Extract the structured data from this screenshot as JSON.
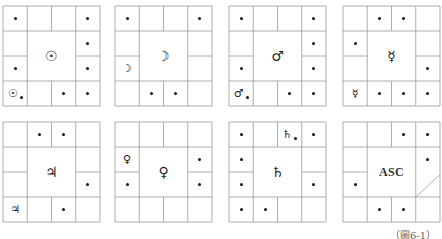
{
  "figure": {
    "caption": "（圖6-1）",
    "grid_rows": 4,
    "grid_cols": 4,
    "line_color": "#9a9a9a",
    "boxes": [
      {
        "name": "sun",
        "center_symbol": "☉",
        "left": 3,
        "top": 6,
        "cells": [
          {
            "r": 0,
            "c": 0,
            "dot": true
          },
          {
            "r": 0,
            "c": 3,
            "dot": true
          },
          {
            "r": 1,
            "c": 3,
            "dot": true
          },
          {
            "r": 2,
            "c": 0,
            "dot": true
          },
          {
            "r": 2,
            "c": 3,
            "dot": true
          },
          {
            "r": 3,
            "c": 0,
            "symbol": "☉",
            "dot": true
          },
          {
            "r": 3,
            "c": 2,
            "dot": true
          },
          {
            "r": 3,
            "c": 3,
            "dot": true
          }
        ]
      },
      {
        "name": "moon",
        "center_symbol": "☽",
        "left": 115,
        "top": 6,
        "cells": [
          {
            "r": 0,
            "c": 0,
            "dot": true
          },
          {
            "r": 0,
            "c": 3,
            "dot": true
          },
          {
            "r": 2,
            "c": 0,
            "symbol": "☽"
          },
          {
            "r": 3,
            "c": 1,
            "dot": true
          },
          {
            "r": 3,
            "c": 2,
            "dot": true
          }
        ]
      },
      {
        "name": "mars",
        "center_symbol": "♂",
        "left": 229,
        "top": 6,
        "cells": [
          {
            "r": 0,
            "c": 0,
            "dot": true
          },
          {
            "r": 0,
            "c": 3,
            "dot": true
          },
          {
            "r": 1,
            "c": 3,
            "dot": true
          },
          {
            "r": 2,
            "c": 0,
            "dot": true
          },
          {
            "r": 2,
            "c": 3,
            "dot": true
          },
          {
            "r": 3,
            "c": 0,
            "symbol": "♂",
            "dot": true
          },
          {
            "r": 3,
            "c": 2,
            "dot": true
          },
          {
            "r": 3,
            "c": 3,
            "dot": true
          }
        ]
      },
      {
        "name": "mercury",
        "center_symbol": "☿",
        "left": 343,
        "top": 6,
        "cells": [
          {
            "r": 0,
            "c": 1,
            "dot": true
          },
          {
            "r": 0,
            "c": 2,
            "dot": true
          },
          {
            "r": 1,
            "c": 0,
            "dot": true
          },
          {
            "r": 2,
            "c": 3,
            "dot": true
          },
          {
            "r": 3,
            "c": 0,
            "symbol": "☿"
          },
          {
            "r": 3,
            "c": 1,
            "dot": true
          },
          {
            "r": 3,
            "c": 2,
            "dot": true
          },
          {
            "r": 3,
            "c": 3,
            "dot": true
          }
        ]
      },
      {
        "name": "jupiter",
        "center_symbol": "♃",
        "left": 3,
        "top": 122,
        "cells": [
          {
            "r": 0,
            "c": 1,
            "dot": true
          },
          {
            "r": 0,
            "c": 2,
            "dot": true
          },
          {
            "r": 2,
            "c": 3,
            "dot": true
          },
          {
            "r": 3,
            "c": 0,
            "symbol": "♃"
          },
          {
            "r": 3,
            "c": 2,
            "dot": true
          }
        ]
      },
      {
        "name": "venus",
        "center_symbol": "♀",
        "left": 115,
        "top": 122,
        "cells": [
          {
            "r": 1,
            "c": 0,
            "symbol": "♀"
          },
          {
            "r": 1,
            "c": 3,
            "dot": true
          },
          {
            "r": 2,
            "c": 0,
            "dot": true
          },
          {
            "r": 2,
            "c": 3,
            "dot": true
          }
        ]
      },
      {
        "name": "saturn",
        "center_symbol": "♄",
        "left": 229,
        "top": 122,
        "cells": [
          {
            "r": 0,
            "c": 0,
            "dot": true
          },
          {
            "r": 0,
            "c": 2,
            "symbol": "♄",
            "dot": true
          },
          {
            "r": 0,
            "c": 3,
            "dot": true
          },
          {
            "r": 1,
            "c": 0,
            "dot": true
          },
          {
            "r": 2,
            "c": 0,
            "dot": true
          },
          {
            "r": 2,
            "c": 3,
            "dot": true
          },
          {
            "r": 3,
            "c": 0,
            "dot": true
          },
          {
            "r": 3,
            "c": 1,
            "dot": true
          }
        ]
      },
      {
        "name": "ascendant",
        "center_symbol": "ASC",
        "left": 343,
        "top": 122,
        "diagonal_in_right_column": true,
        "cells": [
          {
            "r": 0,
            "c": 2,
            "dot": true
          },
          {
            "r": 0,
            "c": 3,
            "dot": true
          },
          {
            "r": 1,
            "c": 3,
            "dot": true
          },
          {
            "r": 2,
            "c": 0,
            "dot": true
          },
          {
            "r": 3,
            "c": 1,
            "dot": true
          },
          {
            "r": 3,
            "c": 2,
            "dot": true
          }
        ]
      }
    ]
  }
}
